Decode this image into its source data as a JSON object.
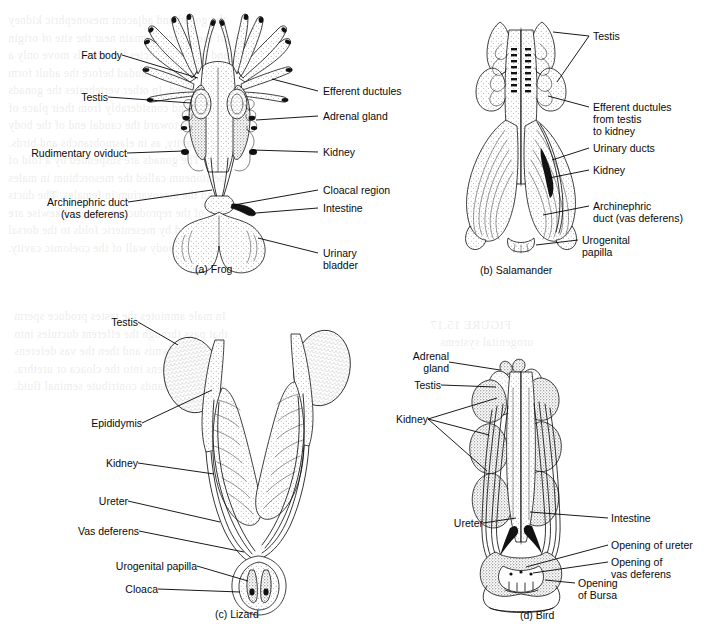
{
  "figure": {
    "background_color": "#ffffff",
    "ink_color": "#111111",
    "showthrough_text_color": "#6d6a63"
  },
  "panels": [
    {
      "id": "a",
      "caption": "(a) Frog",
      "labels_left": [
        {
          "text": "Fat body"
        },
        {
          "text": "Testis"
        },
        {
          "text": "Rudimentary oviduct"
        },
        {
          "text": "Archinephric duct\n(vas deferens)"
        }
      ],
      "labels_right": [
        {
          "text": "Efferent ductules"
        },
        {
          "text": "Adrenal gland"
        },
        {
          "text": "Kidney"
        },
        {
          "text": "Cloacal region"
        },
        {
          "text": "Intestine"
        },
        {
          "text": "Urinary\nbladder"
        }
      ]
    },
    {
      "id": "b",
      "caption": "(b) Salamander",
      "labels_right": [
        {
          "text": "Testis"
        },
        {
          "text": "Efferent ductules\nfrom testis\nto kidney"
        },
        {
          "text": "Urinary ducts"
        },
        {
          "text": "Kidney"
        },
        {
          "text": "Archinephric\nduct (vas deferens)"
        },
        {
          "text": "Urogenital\npapilla"
        }
      ]
    },
    {
      "id": "c",
      "caption": "(c) Lizard",
      "labels_left": [
        {
          "text": "Testis"
        },
        {
          "text": "Epididymis"
        },
        {
          "text": "Kidney"
        },
        {
          "text": "Ureter"
        },
        {
          "text": "Vas deferens"
        },
        {
          "text": "Urogenital papilla"
        },
        {
          "text": "Cloaca"
        }
      ]
    },
    {
      "id": "d",
      "caption": "(d) Bird",
      "labels_left": [
        {
          "text": "Adrenal\ngland"
        },
        {
          "text": "Testis"
        },
        {
          "text": "Kidney"
        },
        {
          "text": "Ureter"
        }
      ],
      "labels_right": [
        {
          "text": "Intestine"
        },
        {
          "text": "Opening of ureter"
        },
        {
          "text": "Opening of\nvas deferens"
        },
        {
          "text": "Opening\nof Bursa"
        }
      ]
    }
  ],
  "showthrough": {
    "lines": [
      "the gonad and adjacent mesonephric kidney",
      "of the embryo remain near the site of origin",
      "and in some species the gonads move only a",
      "short distance caudad before the adult form",
      "is reached. In other vertebrates the gonads",
      "descend considerably from their place of",
      "origin toward the caudal end of the body",
      "cavity, as in elasmobranchs and birds.",
      "The gonads are suspended by a fold of",
      "peritoneum called the mesorchium in males",
      "and the mesovarium in females. The ducts",
      "of the reproductive system likewise are",
      "anchored by mesenteric folds to the dorsal",
      "body wall of the coelomic cavity."
    ],
    "lines_lower": [
      "In male amniotes the testes produce sperm",
      "that pass through the efferent ductules into",
      "the epididymis and then the vas deferens",
      "which opens into the cloaca or urethra.",
      "Accessory glands contribute seminal fluid."
    ],
    "heading_right": "FIGURE 15.17",
    "subheading_right": "urogenital systems"
  }
}
